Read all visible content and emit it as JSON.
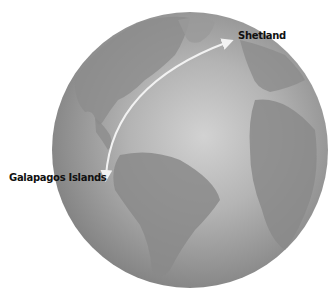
{
  "map": {
    "type": "globe",
    "view": "Atlantic hemisphere (Americas, Europe, Africa)",
    "colors": {
      "ocean_light": "#c9c9c9",
      "ocean_dark": "#8a8a8a",
      "land": "#7a7a7a",
      "arrow": "#f2f2f2"
    },
    "labels": [
      {
        "id": "shetland",
        "text": "Shetland"
      },
      {
        "id": "galapagos",
        "text": "Galapagos Islands"
      }
    ],
    "route": {
      "from": "Shetland",
      "to": "Galapagos Islands",
      "style": "double-headed curved arrow"
    }
  }
}
